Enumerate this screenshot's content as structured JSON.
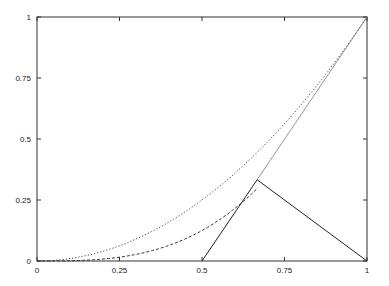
{
  "chart_data": {
    "type": "line",
    "title": "",
    "xlabel": "",
    "ylabel": "",
    "xlim": [
      0,
      1
    ],
    "ylim": [
      0,
      1
    ],
    "grid": false,
    "legend": null,
    "x_ticks": [
      "0",
      "0.25",
      "0.5",
      "0.75",
      "1"
    ],
    "y_ticks": [
      "0",
      "0.25",
      "0.5",
      "0.75",
      "1"
    ],
    "series": [
      {
        "name": "dotted curve (~x^2)",
        "style": "dotted",
        "function": "x^2",
        "x": [
          0,
          0.25,
          0.5,
          0.75,
          1
        ],
        "y": [
          0,
          0.0625,
          0.25,
          0.5625,
          1
        ]
      },
      {
        "name": "dashed curve (~x^3)",
        "style": "dashed",
        "function": "x^3",
        "x": [
          0,
          0.25,
          0.5,
          0.667
        ],
        "y": [
          0,
          0.016,
          0.125,
          0.296
        ]
      },
      {
        "name": "rising segment",
        "style": "solid",
        "x": [
          0.5,
          0.667
        ],
        "y": [
          0,
          0.333
        ]
      },
      {
        "name": "thin diagonal",
        "style": "solid-thin",
        "x": [
          0.667,
          1
        ],
        "y": [
          0.333,
          1
        ]
      },
      {
        "name": "falling segment",
        "style": "solid",
        "x": [
          0.667,
          1
        ],
        "y": [
          0.333,
          0
        ]
      }
    ],
    "annotations": []
  }
}
